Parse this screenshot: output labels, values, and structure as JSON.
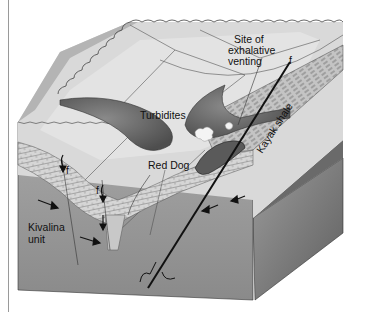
{
  "diagram": {
    "type": "geologic-block-diagram",
    "labels": {
      "site_line1": "Site of",
      "site_line2": "exhalative",
      "site_line3": "venting",
      "fault": "f",
      "turbidites": "Turbidites",
      "red_dog": "Red Dog",
      "kayak_shale": "Kayak shale",
      "kivalina_line1": "Kivalina",
      "kivalina_line2": "unit",
      "fault_small_1": "f",
      "fault_small_2": "f"
    },
    "colors": {
      "background": "#ffffff",
      "top_surface": "#d8d8d8",
      "top_surface_light": "#e6e6e6",
      "slope": "#b8b8b8",
      "front_face": "#9a9a9a",
      "side_face": "#7c7c7c",
      "turbidite_fill": "#707070",
      "limestone": "#d2d2d2",
      "line": "#222222"
    }
  }
}
